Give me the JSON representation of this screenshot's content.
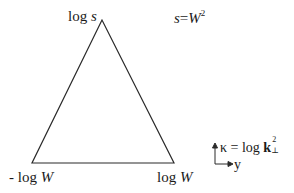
{
  "diagram": {
    "shape": "triangle",
    "vertices": {
      "apex": {
        "label_prefix": "log ",
        "label_var": "s"
      },
      "bottom_left": {
        "label_prefix": "- log ",
        "label_var": "W"
      },
      "bottom_right": {
        "label_prefix": "log ",
        "label_var": "W"
      }
    },
    "relation": {
      "lhs": "s",
      "eq": "=",
      "rhs_var": "W",
      "rhs_exp": "2"
    },
    "axes_legend": {
      "vertical_label": "κ = log ",
      "vertical_bold": "k",
      "vertical_sup": "2",
      "vertical_sub": "⊥",
      "horizontal_label": "y"
    },
    "colors": {
      "stroke": "#2a2a2a",
      "background": "#ffffff"
    }
  }
}
